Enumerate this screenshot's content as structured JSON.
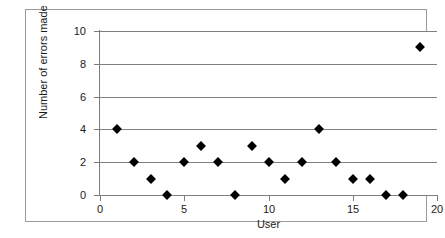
{
  "chart_data": {
    "type": "scatter",
    "title": "",
    "xlabel": "User",
    "ylabel": "Number of errors made",
    "xlim": [
      0,
      20
    ],
    "ylim": [
      0,
      10
    ],
    "xticks": [
      0,
      5,
      10,
      15,
      20
    ],
    "yticks": [
      0,
      2,
      4,
      6,
      8,
      10
    ],
    "xtick_labels": [
      "0",
      "5",
      "10",
      "15",
      "20"
    ],
    "ytick_labels": [
      "0",
      "2",
      "4",
      "6",
      "8",
      "10"
    ],
    "grid": "horizontal",
    "legend": "none",
    "marker": "diamond",
    "marker_color": "#000000",
    "gridline_color": "#808080",
    "axis_color": "#7d7d7d",
    "frame_color": "#9a9a9a",
    "background": "#ffffff",
    "x": [
      1,
      2,
      3,
      4,
      5,
      6,
      7,
      8,
      9,
      10,
      11,
      12,
      13,
      14,
      15,
      16,
      17,
      18,
      19
    ],
    "y": [
      4,
      2,
      1,
      0,
      2,
      3,
      2,
      0,
      3,
      2,
      1,
      2,
      4,
      2,
      1,
      1,
      0,
      0,
      9
    ],
    "points": [
      {
        "x": 1,
        "y": 4
      },
      {
        "x": 2,
        "y": 2
      },
      {
        "x": 3,
        "y": 1
      },
      {
        "x": 4,
        "y": 0
      },
      {
        "x": 5,
        "y": 2
      },
      {
        "x": 6,
        "y": 3
      },
      {
        "x": 7,
        "y": 2
      },
      {
        "x": 8,
        "y": 0
      },
      {
        "x": 9,
        "y": 3
      },
      {
        "x": 10,
        "y": 2
      },
      {
        "x": 11,
        "y": 1
      },
      {
        "x": 12,
        "y": 2
      },
      {
        "x": 13,
        "y": 4
      },
      {
        "x": 14,
        "y": 2
      },
      {
        "x": 15,
        "y": 1
      },
      {
        "x": 16,
        "y": 1
      },
      {
        "x": 17,
        "y": 0
      },
      {
        "x": 18,
        "y": 0
      },
      {
        "x": 19,
        "y": 9
      }
    ]
  }
}
